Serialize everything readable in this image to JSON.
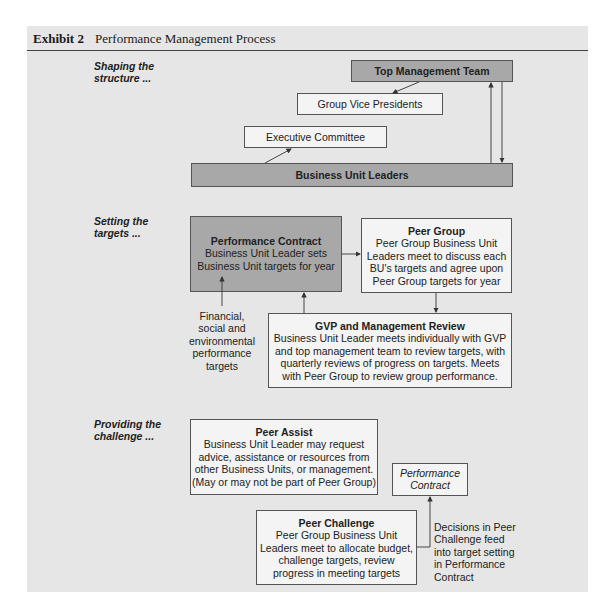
{
  "header": {
    "exhibit": "Exhibit 2",
    "title": "Performance Management Process"
  },
  "sections": [
    {
      "label_line1": "Shaping the",
      "label_line2": "structure ..."
    },
    {
      "label_line1": "Setting the",
      "label_line2": "targets ..."
    },
    {
      "label_line1": "Providing the",
      "label_line2": "challenge ..."
    }
  ],
  "structure": {
    "top_management": "Top Management Team",
    "group_vps": "Group Vice Presidents",
    "executive_committee": "Executive Committee",
    "business_unit_leaders": "Business Unit Leaders"
  },
  "targets": {
    "performance_contract": {
      "title": "Performance Contract",
      "lines": [
        "Business Unit Leader sets",
        "Business Unit targets for year"
      ]
    },
    "peer_group": {
      "title": "Peer Group",
      "lines": [
        "Peer Group Business Unit",
        "Leaders meet to discuss each",
        "BU's targets and agree upon",
        "Peer Group targets for year"
      ]
    },
    "gvp_review": {
      "title": "GVP and Management Review",
      "lines": [
        "Business Unit Leader meets individually with GVP",
        "and top management team to review targets, with",
        "quarterly reviews of progress on targets. Meets",
        "with Peer Group to review group performance."
      ]
    },
    "inputs_label": [
      "Financial,",
      "social and",
      "environmental",
      "performance",
      "targets"
    ]
  },
  "challenge": {
    "peer_assist": {
      "title": "Peer Assist",
      "lines": [
        "Business Unit Leader may request",
        "advice, assistance or resources from",
        "other Business Units, or management.",
        "(May or may not be part of Peer Group)"
      ]
    },
    "performance_contract_ref": [
      "Performance",
      "Contract"
    ],
    "peer_challenge": {
      "title": "Peer Challenge",
      "lines": [
        "Peer Group Business Unit",
        "Leaders meet to allocate budget,",
        "challenge targets, review",
        "progress in meeting targets"
      ]
    },
    "feed_note": [
      "Decisions in Peer",
      "Challenge feed",
      "into target setting",
      "in Performance",
      "Contract"
    ]
  },
  "colors": {
    "panel": "#e6e6e6",
    "dark_box": "#a8a8a8",
    "light_box": "#f4f4f4",
    "stroke": "#555555"
  }
}
